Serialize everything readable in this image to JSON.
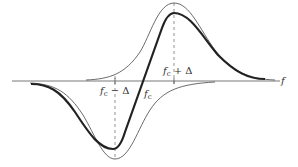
{
  "figure": {
    "axis_label": "f",
    "labels": {
      "fc_minus_delta": {
        "base": "f",
        "sub": "c",
        "rest": " − Δ"
      },
      "fc": {
        "base": "f",
        "sub": "c"
      },
      "fc_plus_delta": {
        "base": "f",
        "sub": "c",
        "rest": " + Δ"
      }
    },
    "colors": {
      "ink": "#222222",
      "thin": "#444444",
      "dash": "#666666"
    }
  }
}
